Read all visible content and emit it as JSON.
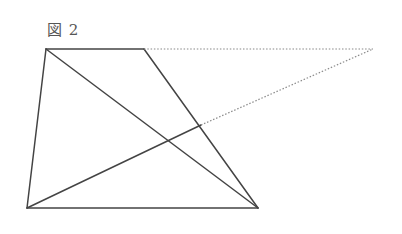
{
  "figure": {
    "label": "図 2"
  },
  "diagram": {
    "type": "geometry",
    "shape": "trapezoid with diagonals and extended lines",
    "points": {
      "A": [
        46,
        49
      ],
      "D": [
        144,
        49
      ],
      "B": [
        27,
        208
      ],
      "C": [
        258,
        208
      ],
      "E": [
        201,
        125
      ],
      "P": [
        373,
        49
      ]
    },
    "solid_segments": [
      [
        "A",
        "D"
      ],
      [
        "A",
        "B"
      ],
      [
        "B",
        "C"
      ],
      [
        "D",
        "C"
      ],
      [
        "A",
        "C"
      ],
      [
        "B",
        "E"
      ]
    ],
    "dotted_segments": [
      [
        "D",
        "P"
      ],
      [
        "E",
        "P"
      ]
    ],
    "colors": {
      "solid": "#444444",
      "dotted": "#888888",
      "label": "#555555"
    }
  }
}
